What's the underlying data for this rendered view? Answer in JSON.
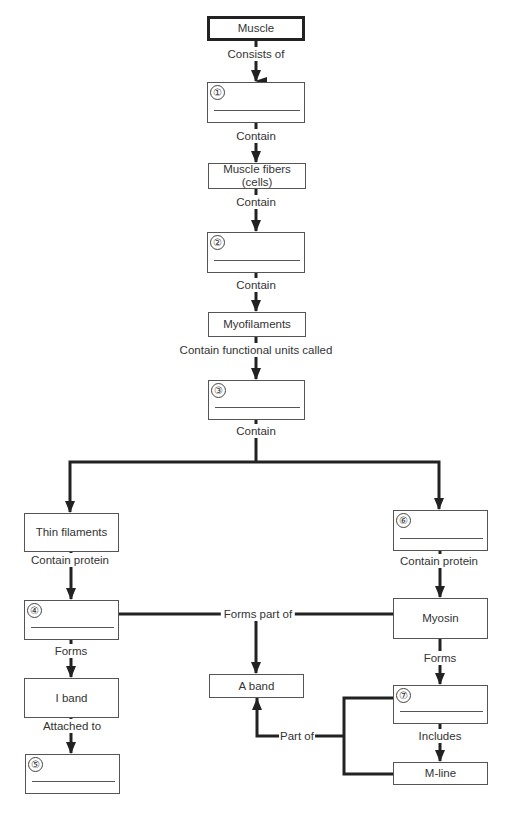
{
  "diagram": {
    "title": "Muscle",
    "nodes": {
      "muscle": {
        "label": "Muscle"
      },
      "blank1": {
        "number": "①",
        "label": ""
      },
      "muscle_fibers": {
        "label": "Muscle fibers (cells)",
        "line1": "Muscle fibers",
        "line2": "(cells)"
      },
      "blank2": {
        "number": "②",
        "label": ""
      },
      "myofilaments": {
        "label": "Myofilaments"
      },
      "blank3": {
        "number": "③",
        "label": ""
      },
      "thin_filaments": {
        "label": "Thin filaments"
      },
      "blank4": {
        "number": "④",
        "label": ""
      },
      "i_band": {
        "label": "I band"
      },
      "blank5": {
        "number": "⑤",
        "label": ""
      },
      "blank6": {
        "number": "⑥",
        "label": ""
      },
      "myosin": {
        "label": "Myosin"
      },
      "a_band": {
        "label": "A band"
      },
      "blank7": {
        "number": "⑦",
        "label": ""
      },
      "m_line": {
        "label": "M-line"
      }
    },
    "edges": {
      "consists_of": "Consists of",
      "contain1": "Contain",
      "contain2": "Contain",
      "contain3": "Contain",
      "contain_functional_units": "Contain functional units called",
      "contain4": "Contain",
      "contain_protein_left": "Contain protein",
      "contain_protein_right": "Contain protein",
      "forms_left": "Forms",
      "forms_right": "Forms",
      "forms_part_of": "Forms part of",
      "attached_to": "Attached to",
      "includes": "Includes",
      "part_of": "Part of"
    },
    "colors": {
      "line": "#222222",
      "box_border": "#555555",
      "text": "#333333"
    }
  }
}
